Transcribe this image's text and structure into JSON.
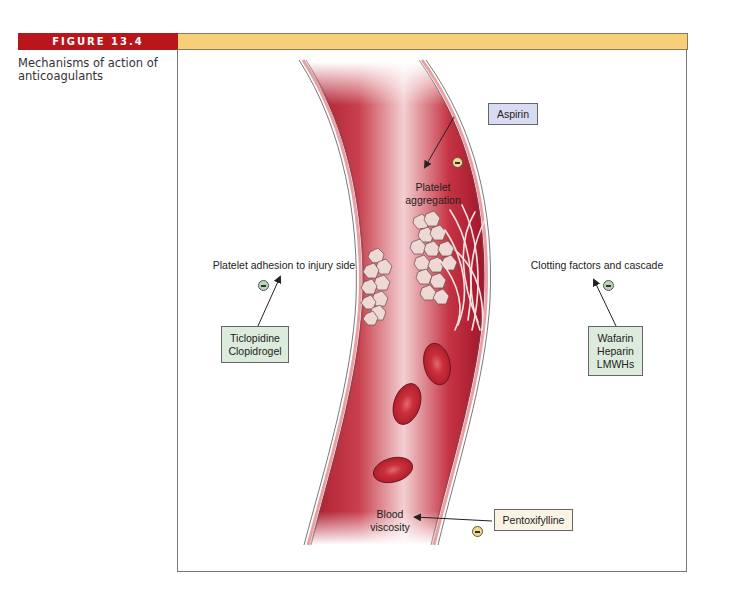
{
  "figure": {
    "number_label": "FIGURE 13.4",
    "caption": "Mechanisms of action of anticoagulants"
  },
  "colors": {
    "figure_label_bg": "#b8161b",
    "header_bar": "#f6cf78",
    "vessel_dark": "#b01e2e",
    "vessel_light": "#f6d6d8",
    "vessel_wall": "#e8a0a5",
    "aspirin_box": "#d9dbf2",
    "green_box": "#dcebdc",
    "cream_box": "#fbf3e4"
  },
  "targets": {
    "platelet_aggregation": [
      "Platelet",
      "aggregation"
    ],
    "platelet_adhesion": "Platelet adhesion to injury side",
    "clotting_factors": "Clotting factors and cascade",
    "blood_viscosity": [
      "Blood",
      "viscosity"
    ]
  },
  "drugs": {
    "aspirin": [
      "Aspirin"
    ],
    "adhesion_inhibitors": [
      "Ticlopidine",
      "Clopidrogel"
    ],
    "clotting_inhibitors": [
      "Wafarin",
      "Heparin",
      "LMWHs"
    ],
    "viscosity_reducer": [
      "Pentoxifylline"
    ]
  },
  "icons": {
    "inhibition_symbol": "minus-in-circle"
  }
}
